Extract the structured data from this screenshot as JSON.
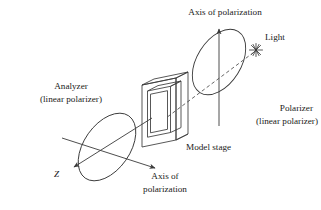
{
  "figure": {
    "type": "optics-schematic",
    "background_color": "#ffffff",
    "line_color": "#3a3a3a",
    "text_color": "#1a1a1a"
  },
  "labels": {
    "axis_of_polarization_top": "Axis of polarization",
    "light": "Light",
    "polarizer_name": "Polarizer",
    "polarizer_sub": "(linear polarizer)",
    "model_stage": "Model stage",
    "analyzer_name": "Analyzer",
    "analyzer_sub": "(linear polarizer)",
    "z_axis": "Z",
    "axis_of_polarization_bottom_line1": "Axis of",
    "axis_of_polarization_bottom_line2": "polarization"
  },
  "elements": {
    "polarizer_disc": {
      "name": "polarizer-ellipse",
      "center": [
        219,
        62
      ],
      "rx": 36,
      "ry": 22,
      "rotation_deg": -58
    },
    "analyzer_disc": {
      "name": "analyzer-ellipse",
      "center": [
        107,
        147
      ],
      "rx": 38,
      "ry": 23,
      "rotation_deg": -55
    },
    "model_stage_frame": {
      "name": "model-stage",
      "front_face": [
        [
          142,
          85
        ],
        [
          176,
          78
        ],
        [
          176,
          140
        ],
        [
          142,
          147
        ]
      ],
      "depth_offset": [
        12,
        6
      ]
    },
    "light_source_star": {
      "name": "light-star",
      "position": [
        256,
        50
      ],
      "rays": 8
    },
    "vertical_polarization_axis": {
      "from": [
        219,
        125
      ],
      "to": [
        219,
        26
      ],
      "arrow_at": "top"
    },
    "z_axis_arrow": {
      "from": [
        150,
        120
      ],
      "to": [
        73,
        168
      ],
      "arrow_at": "end"
    },
    "horizontal_polarization_axis": {
      "from": [
        63,
        139
      ],
      "to": [
        156,
        169
      ],
      "arrow_at": "end"
    },
    "light_ray": {
      "from": [
        254,
        52
      ],
      "to": [
        166,
        118
      ],
      "style": "dashed"
    }
  }
}
